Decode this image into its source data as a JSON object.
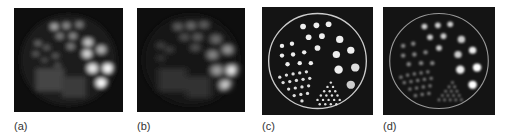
{
  "figure": {
    "panels": [
      {
        "id": "a",
        "label": "(a)",
        "style": "blurred",
        "ring": false
      },
      {
        "id": "b",
        "label": "(b)",
        "style": "blurred-more",
        "ring": false
      },
      {
        "id": "c",
        "label": "(c)",
        "style": "sharp",
        "ring": true
      },
      {
        "id": "d",
        "label": "(d)",
        "style": "soft",
        "ring": true
      }
    ],
    "background_color": "#111111",
    "spot_color": "#ffffff"
  }
}
